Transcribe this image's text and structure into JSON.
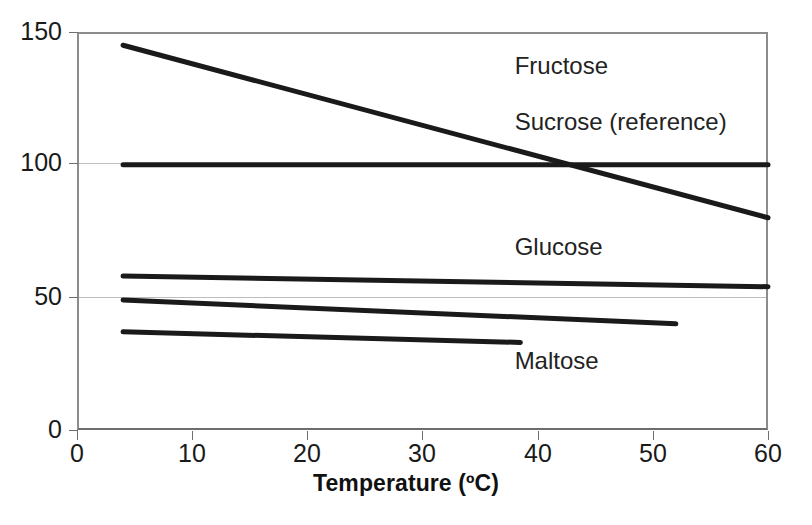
{
  "chart_data": {
    "type": "line",
    "title": "",
    "xlabel": "Temperature (ºC)",
    "ylabel": "",
    "xlim": [
      0,
      60
    ],
    "ylim": [
      0,
      150
    ],
    "grid": true,
    "legend": "inline-labels",
    "x_ticks": [
      "0",
      "10",
      "20",
      "30",
      "40",
      "50",
      "60"
    ],
    "x_tick_values": [
      0,
      10,
      20,
      30,
      40,
      50,
      60
    ],
    "y_ticks": [
      "0",
      "50",
      "100",
      "150"
    ],
    "y_tick_values": [
      0,
      50,
      100,
      150
    ],
    "series": [
      {
        "name": "Fructose",
        "label": "Fructose",
        "x": [
          4,
          60
        ],
        "values": [
          145,
          80
        ],
        "label_x": 38,
        "label_y": 137
      },
      {
        "name": "Sucrose (reference)",
        "label": "Sucrose (reference)",
        "x": [
          4,
          60
        ],
        "values": [
          100,
          100
        ],
        "label_x": 38,
        "label_y": 116
      },
      {
        "name": "Glucose",
        "label": "Glucose",
        "x": [
          4,
          60
        ],
        "values": [
          58,
          54
        ],
        "label_x": 38,
        "label_y": 69
      },
      {
        "name": "Galactose",
        "label": "Galactose",
        "x": [
          4,
          52
        ],
        "values": [
          49,
          40
        ],
        "label_x": 206,
        "label_y": 38
      },
      {
        "name": "Maltose",
        "label": "Maltose",
        "x": [
          4,
          38.5
        ],
        "values": [
          37,
          33
        ],
        "label_x": 38,
        "label_y": 26
      }
    ],
    "colors": {
      "line": "#1a1a1a",
      "grid": "#bdbdbd",
      "frame": "#8c8c8c",
      "text": "#1a1a1a",
      "background": "#ffffff"
    }
  },
  "axis_titles": {
    "x": "Temperature (ºC)"
  },
  "ticks": {
    "y": [
      {
        "label": "150",
        "value": 150
      },
      {
        "label": "100",
        "value": 100
      },
      {
        "label": "50",
        "value": 50
      },
      {
        "label": "0",
        "value": 0
      }
    ],
    "x": [
      {
        "label": "0",
        "value": 0
      },
      {
        "label": "10",
        "value": 10
      },
      {
        "label": "20",
        "value": 20
      },
      {
        "label": "30",
        "value": 30
      },
      {
        "label": "40",
        "value": 40
      },
      {
        "label": "50",
        "value": 50
      },
      {
        "label": "60",
        "value": 60
      }
    ]
  }
}
